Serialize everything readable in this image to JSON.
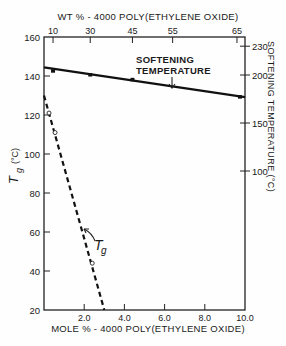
{
  "chart_data": {
    "type": "line",
    "title": "",
    "xlabel": "MOLE % - 4000 POLY(ETHYLENE OXIDE)",
    "x2label": "WT % - 4000 POLY(ETHYLENE OXIDE)",
    "ylabel": "Tg (°C)",
    "y2label": "SOFTENING TEMPERATURE (°C)",
    "xlim": [
      0,
      10.0
    ],
    "ylim": [
      20,
      160
    ],
    "y2lim": [
      105,
      235
    ],
    "x_ticks": [
      "2.0",
      "4.0",
      "6.0",
      "8.0",
      "10.0"
    ],
    "x_tick_values": [
      2.0,
      4.0,
      6.0,
      8.0,
      10.0
    ],
    "x2_ticks": [
      "10",
      "30",
      "45",
      "55",
      "65"
    ],
    "x2_tick_positions_mole_pct": [
      0.45,
      2.3,
      4.4,
      6.4,
      9.6
    ],
    "y_ticks": [
      "20",
      "40",
      "60",
      "80",
      "100",
      "120",
      "140",
      "160"
    ],
    "y_tick_values": [
      20,
      40,
      60,
      80,
      100,
      120,
      140,
      160
    ],
    "y2_ticks": [
      "100",
      "150",
      "200",
      "230"
    ],
    "y2_tick_values": [
      100,
      150,
      200,
      230
    ],
    "grid": false,
    "series": [
      {
        "name": "Softening Temperature",
        "axis": "right",
        "style": "solid",
        "marker": "filled-square",
        "line": {
          "x": [
            0,
            10.0
          ],
          "y": [
            208,
            177
          ]
        },
        "points": {
          "x": [
            0.45,
            2.3,
            4.4,
            9.75
          ],
          "y": [
            205,
            201,
            196,
            178
          ]
        }
      },
      {
        "name": "Tg",
        "axis": "left",
        "style": "dashed",
        "marker": "open-circle",
        "line": {
          "x": [
            0,
            3.0
          ],
          "y": [
            130,
            20
          ]
        },
        "points": {
          "x": [
            0.25,
            0.55,
            2.4
          ],
          "y": [
            121,
            111,
            44
          ]
        }
      }
    ],
    "annotations": [
      {
        "text": "SOFTENING TEMPERATURE",
        "arrow_to": "softening-line",
        "x": 6.0
      },
      {
        "text": "Tg",
        "arrow_to": "tg-line",
        "x": 1.9
      }
    ]
  },
  "labels": {
    "top_axis_title": "WT % - 4000 POLY(ETHYLENE OXIDE)",
    "bottom_axis_title": "MOLE % - 4000 POLY(ETHYLENE OXIDE)",
    "left_axis_title_main": "T",
    "left_axis_title_sub": "g",
    "left_axis_title_unit": "(°C)",
    "right_axis_title": "SOFTENING TEMPERATURE  (°C)",
    "softening_annotation_line1": "SOFTENING",
    "softening_annotation_line2": "TEMPERATURE",
    "tg_annotation_main": "T",
    "tg_annotation_sub": "g"
  }
}
